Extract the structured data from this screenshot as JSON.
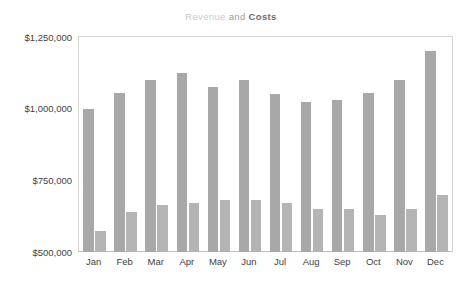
{
  "chart_data": {
    "type": "bar",
    "title": "Revenue and Costs",
    "title_parts": {
      "series_a": "Revenue",
      "conjunction": " and ",
      "series_b": "Costs"
    },
    "xlabel": "",
    "ylabel": "",
    "categories": [
      "Jan",
      "Feb",
      "Mar",
      "Apr",
      "May",
      "Jun",
      "Jul",
      "Aug",
      "Sep",
      "Oct",
      "Nov",
      "Dec"
    ],
    "series": [
      {
        "name": "Revenue",
        "color": "#a8a8a8",
        "values": [
          1000000,
          1053000,
          1100000,
          1125000,
          1075000,
          1100000,
          1050000,
          1025000,
          1030000,
          1053000,
          1100000,
          1200000
        ]
      },
      {
        "name": "Costs",
        "color": "#b4b4b4",
        "values": [
          575000,
          640000,
          665000,
          670000,
          680000,
          680000,
          670000,
          650000,
          650000,
          630000,
          650000,
          700000
        ]
      }
    ],
    "ylim": [
      500000,
      1250000
    ],
    "yticks": [
      500000,
      750000,
      1000000,
      1250000
    ],
    "ytick_labels": [
      "$500,000",
      "$750,000",
      "$1,000,000",
      "$1,250,000"
    ],
    "grid": false,
    "legend": "none"
  }
}
